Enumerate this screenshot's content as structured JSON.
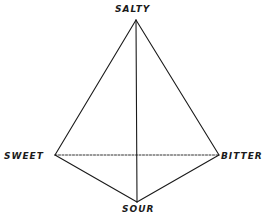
{
  "diagram": {
    "type": "taste-tetrahedron",
    "vertices": [
      {
        "id": "salty",
        "label": "SALTY",
        "x": 136,
        "y": 20
      },
      {
        "id": "sweet",
        "label": "SWEET",
        "x": 55,
        "y": 155
      },
      {
        "id": "bitter",
        "label": "BITTER",
        "x": 219,
        "y": 155
      },
      {
        "id": "sour",
        "label": "SOUR",
        "x": 137,
        "y": 202
      }
    ],
    "edges": [
      {
        "from": "salty",
        "to": "sweet",
        "style": "solid"
      },
      {
        "from": "salty",
        "to": "bitter",
        "style": "solid"
      },
      {
        "from": "salty",
        "to": "sour",
        "style": "solid"
      },
      {
        "from": "sweet",
        "to": "sour",
        "style": "solid"
      },
      {
        "from": "bitter",
        "to": "sour",
        "style": "solid"
      },
      {
        "from": "sweet",
        "to": "bitter",
        "style": "dashed"
      }
    ],
    "colors": {
      "line": "#1a1a1a",
      "background": "#ffffff"
    }
  },
  "labels": {
    "salty": "SALTY",
    "sweet": "SWEET",
    "bitter": "BITTER",
    "sour": "SOUR"
  }
}
